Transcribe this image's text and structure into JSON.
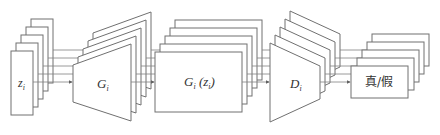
{
  "diagram": {
    "type": "GAN pipeline (feature-map stacks)",
    "colors": {
      "stroke": "#707070",
      "fill": "#ffffff",
      "text": "#333333",
      "connector": "#808080"
    },
    "layer_count": 5,
    "nodes": [
      {
        "id": "input",
        "shape": "rectangle-stack",
        "label_main": "z",
        "label_sub": "i"
      },
      {
        "id": "generator",
        "shape": "trapezoid-stack-expanding",
        "label_main": "G",
        "label_sub": "i"
      },
      {
        "id": "generated",
        "shape": "rectangle-stack",
        "label_main": "G",
        "label_sub": "i",
        "label_tail": " (z",
        "label_tail_sub": "i",
        "label_close": ")"
      },
      {
        "id": "discriminator",
        "shape": "trapezoid-stack-contracting",
        "label_main": "D",
        "label_sub": "i"
      },
      {
        "id": "output",
        "shape": "rectangle-stack",
        "label": "真/假"
      }
    ],
    "edges": [
      {
        "from": "input",
        "to": "generator",
        "lines": 5
      },
      {
        "from": "generator",
        "to": "generated",
        "lines": 5
      },
      {
        "from": "generated",
        "to": "discriminator",
        "lines": 5
      },
      {
        "from": "discriminator",
        "to": "output",
        "lines": 5
      }
    ]
  }
}
